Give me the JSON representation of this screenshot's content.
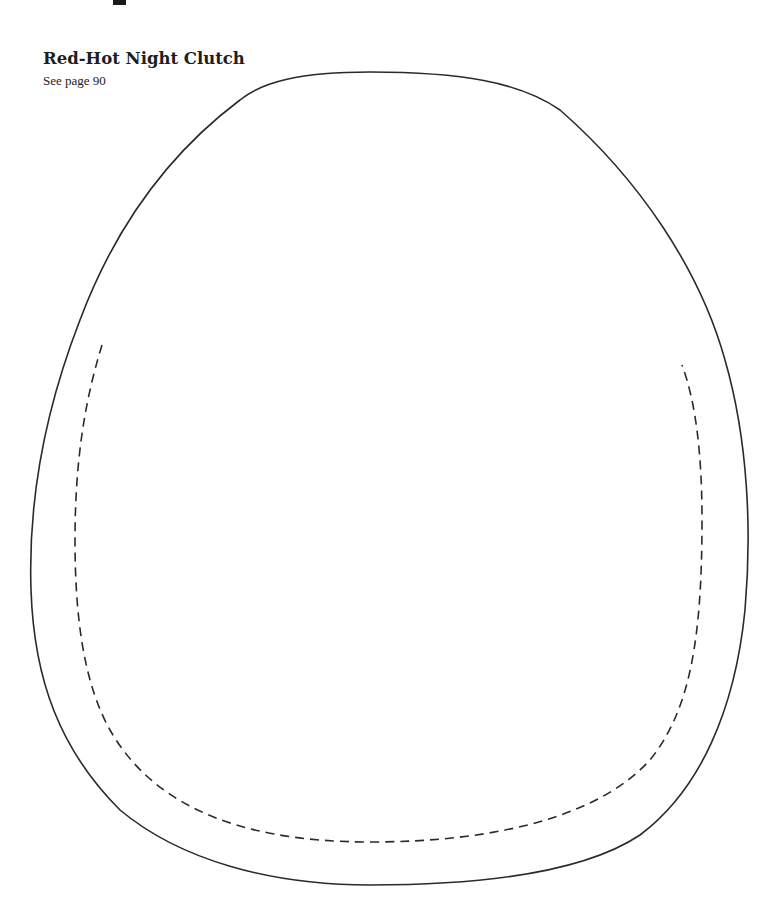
{
  "page": {
    "heading_fragment": "p"
  },
  "pattern": {
    "title": "Red-Hot Night Clutch",
    "reference": "See page 90",
    "outline_color": "#2a2a2a",
    "seam_color": "#2a2a2a"
  }
}
